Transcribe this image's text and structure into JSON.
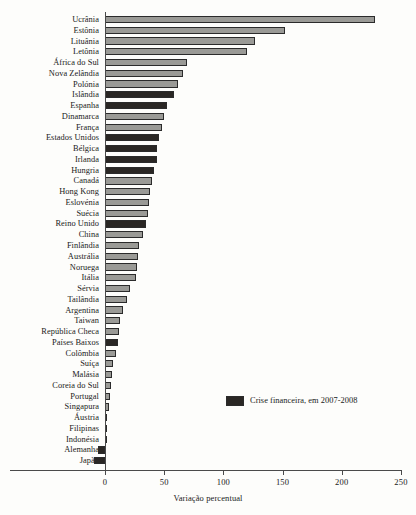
{
  "chart_data": {
    "type": "bar",
    "orientation": "horizontal",
    "title": "",
    "xlabel": "Variação percentual",
    "ylabel": "",
    "xlim": [
      -12,
      250
    ],
    "xticks": [
      0,
      50,
      100,
      150,
      200,
      250
    ],
    "xtick_labels": [
      "0",
      "50",
      "100",
      "150",
      "200",
      "250"
    ],
    "grid": false,
    "legend": {
      "position": "inside-right",
      "entries": [
        {
          "label": "Crise financeira, em 2007-2008",
          "color": "#2a2724"
        }
      ]
    },
    "series_colors": {
      "normal": "#9a9a96",
      "crisis": "#2a2724"
    },
    "categories": [
      "Ucrânia",
      "Estônia",
      "Lituânia",
      "Letônia",
      "África do Sul",
      "Nova Zelândia",
      "Polónia",
      "Islândia",
      "Espanha",
      "Dinamarca",
      "França",
      "Estados Unidos",
      "Bélgica",
      "Irlanda",
      "Hungria",
      "Canadá",
      "Hong Kong",
      "Eslovénia",
      "Suécia",
      "Reino Unido",
      "China",
      "Finlândia",
      "Austrália",
      "Noruega",
      "Itália",
      "Sérvia",
      "Tailândia",
      "Argentina",
      "Taiwan",
      "República Checa",
      "Países Baixos",
      "Colômbia",
      "Suíça",
      "Malásia",
      "Coreia do Sul",
      "Portugal",
      "Singapura",
      "Áustria",
      "Filipinas",
      "Indonésia",
      "Alemanha",
      "Japão"
    ],
    "values": [
      228,
      152,
      127,
      120,
      69,
      66,
      62,
      58,
      52,
      50,
      48,
      46,
      44,
      44,
      41,
      40,
      38,
      37,
      36,
      35,
      32,
      29,
      28,
      27,
      26,
      21,
      19,
      15,
      13,
      12,
      11,
      9,
      7,
      6,
      5,
      4,
      3,
      2,
      1,
      1,
      -6,
      -9
    ],
    "bar_types": [
      "normal",
      "normal",
      "normal",
      "normal",
      "normal",
      "normal",
      "normal",
      "crisis",
      "crisis",
      "normal",
      "normal",
      "crisis",
      "crisis",
      "crisis",
      "crisis",
      "normal",
      "normal",
      "normal",
      "normal",
      "crisis",
      "normal",
      "normal",
      "normal",
      "normal",
      "normal",
      "normal",
      "normal",
      "normal",
      "normal",
      "normal",
      "crisis",
      "normal",
      "normal",
      "normal",
      "normal",
      "normal",
      "normal",
      "crisis",
      "normal",
      "normal",
      "crisis",
      "crisis"
    ]
  }
}
